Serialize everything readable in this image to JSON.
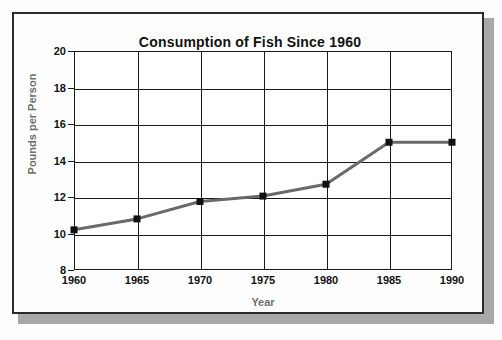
{
  "chart_data": {
    "type": "line",
    "title": "Consumption of Fish Since 1960",
    "xlabel": "Year",
    "ylabel": "Pounds per Person",
    "x": [
      1960,
      1965,
      1970,
      1975,
      1980,
      1985,
      1990
    ],
    "categories": [
      "1960",
      "1965",
      "1970",
      "1975",
      "1980",
      "1985",
      "1990"
    ],
    "values": [
      10.2,
      10.8,
      11.75,
      12.05,
      12.7,
      15.0,
      15.0
    ],
    "series": [
      {
        "name": "Pounds per Person",
        "values": [
          10.2,
          10.8,
          11.75,
          12.05,
          12.7,
          15.0,
          15.0
        ]
      }
    ],
    "xlim": [
      1960,
      1990
    ],
    "ylim": [
      8,
      20
    ],
    "ytick_labels": [
      "8",
      "10",
      "12",
      "14",
      "16",
      "18",
      "20"
    ],
    "ytick_values": [
      8,
      10,
      12,
      14,
      16,
      18,
      20
    ],
    "xtick_labels": [
      "1960",
      "1965",
      "1970",
      "1975",
      "1980",
      "1985",
      "1990"
    ],
    "xtick_values": [
      1960,
      1965,
      1970,
      1975,
      1980,
      1985,
      1990
    ],
    "grid": true,
    "legend": "none",
    "line_color": "#6a6a6a",
    "marker_color": "#111111",
    "marker": "square",
    "axis_color": "#1a1a1a",
    "title_color": "#111111",
    "axis_label_color": "#6e6e6e",
    "tick_label_color": "#111111"
  }
}
